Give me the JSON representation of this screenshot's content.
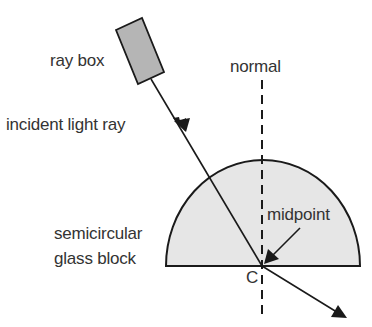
{
  "diagram": {
    "labels": {
      "ray_box": "ray box",
      "normal": "normal",
      "incident_ray": "incident light ray",
      "glass_block_line1": "semicircular",
      "glass_block_line2": "glass block",
      "midpoint": "midpoint",
      "center_point": "C"
    },
    "colors": {
      "stroke": "#1a1a1a",
      "ray_box_fill": "#b5b5b5",
      "glass_fill": "#e6e6e6",
      "text": "#333333"
    }
  }
}
